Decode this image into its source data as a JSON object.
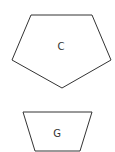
{
  "shapes": [
    {
      "id": "pentagon",
      "label": "C",
      "points": "31,15 92,15 111,60 62,88 12,60",
      "label_x": 61,
      "label_y": 50
    },
    {
      "id": "trapezoid",
      "label": "G",
      "points": "23,112 92,112 80,151 35,151",
      "label_x": 57,
      "label_y": 137
    }
  ],
  "colors": {
    "stroke": "#333333",
    "fill": "#ffffff"
  }
}
